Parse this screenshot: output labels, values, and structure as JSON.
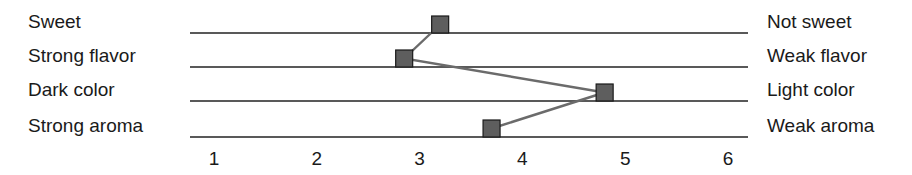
{
  "chart_data": {
    "type": "line",
    "title": "",
    "xlabel": "",
    "ylabel": "",
    "xlim": [
      1,
      6
    ],
    "x_ticks": [
      "1",
      "2",
      "3",
      "4",
      "5",
      "6"
    ],
    "grid": false,
    "legend": "none",
    "scales": [
      {
        "left_label": "Sweet",
        "right_label": "Not sweet",
        "value": 3.2
      },
      {
        "left_label": "Strong flavor",
        "right_label": "Weak flavor",
        "value": 2.85
      },
      {
        "left_label": "Dark color",
        "right_label": "Light color",
        "value": 4.8
      },
      {
        "left_label": "Strong aroma",
        "right_label": "Weak aroma",
        "value": 3.7
      }
    ],
    "series": [
      {
        "name": "Profile",
        "values": [
          3.2,
          2.85,
          4.8,
          3.7
        ]
      }
    ],
    "colors": {
      "marker": "#5e5e5e",
      "line": "#6b6b6b",
      "scale": "#222222"
    }
  }
}
